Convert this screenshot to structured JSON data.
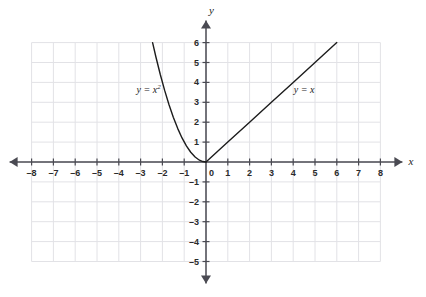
{
  "figure": {
    "background_color": "#ffffff",
    "grid_color": "#e2e2e6",
    "axis_color": "#4a4a52",
    "curve_color": "#1c1c1c",
    "label_color": "#2b2b2b"
  },
  "axes": {
    "x_name": "x",
    "y_name": "y",
    "x_tick_labels": [
      "–8",
      "–7",
      "–6",
      "–5",
      "–4",
      "–3",
      "–2",
      "–1",
      "0",
      "1",
      "2",
      "3",
      "4",
      "5",
      "6",
      "7",
      "8"
    ],
    "y_tick_labels_positive": [
      "1",
      "2",
      "3",
      "4",
      "5",
      "6"
    ],
    "y_tick_labels_negative": [
      "–1",
      "–2",
      "–3",
      "–4",
      "–5"
    ]
  },
  "curve_labels": {
    "parabola": {
      "base": "y = x",
      "exponent": "2"
    },
    "line": {
      "base": "y = x"
    }
  },
  "chart_data": {
    "type": "line",
    "title": "",
    "xlabel": "x",
    "ylabel": "y",
    "xlim": [
      -8,
      8
    ],
    "ylim": [
      -5,
      6
    ],
    "grid": true,
    "legend": "inline-annotations",
    "series": [
      {
        "name": "y = x²",
        "expression": "y = x^2",
        "annotation": "y = x²",
        "annotation_position": {
          "x": -3.0,
          "y": 3.6
        },
        "domain": [
          -2.45,
          0
        ],
        "x": [
          -2.45,
          -2.3,
          -2.1,
          -1.9,
          -1.7,
          -1.5,
          -1.3,
          -1.1,
          -0.9,
          -0.7,
          -0.5,
          -0.3,
          -0.15,
          0
        ],
        "y": [
          6.0,
          5.29,
          4.41,
          3.61,
          2.89,
          2.25,
          1.69,
          1.21,
          0.81,
          0.49,
          0.25,
          0.09,
          0.0225,
          0
        ]
      },
      {
        "name": "y = x",
        "expression": "y = x",
        "annotation": "y = x",
        "annotation_position": {
          "x": 4.3,
          "y": 3.6
        },
        "domain": [
          0,
          6
        ],
        "x": [
          0,
          1,
          2,
          3,
          4,
          5,
          6
        ],
        "y": [
          0,
          1,
          2,
          3,
          4,
          5,
          6
        ]
      }
    ]
  }
}
